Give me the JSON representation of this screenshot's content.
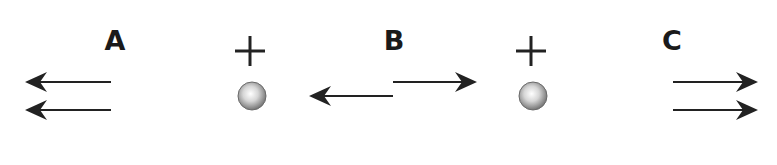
{
  "diagram": {
    "background": "#ffffff",
    "ink_color": "#222222",
    "regions": [
      {
        "label": "A",
        "x": 115,
        "y": 27,
        "field_direction": "left",
        "arrow_count": 2
      },
      {
        "label": "B",
        "x": 394,
        "y": 27,
        "field_direction": "opposing",
        "arrow_count": 2
      },
      {
        "label": "C",
        "x": 672,
        "y": 27,
        "field_direction": "right",
        "arrow_count": 2
      }
    ],
    "charges": [
      {
        "sign": "+",
        "x": 252,
        "y": 96,
        "radius": 14
      },
      {
        "sign": "+",
        "x": 533,
        "y": 96,
        "radius": 14
      }
    ],
    "arrows": [
      {
        "region": "A",
        "from": [
          111,
          82
        ],
        "to": [
          25,
          82
        ],
        "direction": "left"
      },
      {
        "region": "A",
        "from": [
          111,
          110
        ],
        "to": [
          25,
          110
        ],
        "direction": "left"
      },
      {
        "region": "B",
        "from": [
          393,
          96
        ],
        "to": [
          309,
          96
        ],
        "direction": "left"
      },
      {
        "region": "B",
        "from": [
          393,
          82
        ],
        "to": [
          477,
          82
        ],
        "direction": "right"
      },
      {
        "region": "C",
        "from": [
          673,
          82
        ],
        "to": [
          758,
          82
        ],
        "direction": "right"
      },
      {
        "region": "C",
        "from": [
          673,
          110
        ],
        "to": [
          758,
          110
        ],
        "direction": "right"
      }
    ]
  }
}
